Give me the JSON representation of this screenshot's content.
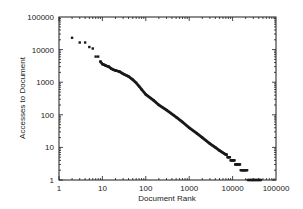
{
  "chart_data": {
    "type": "scatter",
    "title": "",
    "xlabel": "Document Rank",
    "ylabel": "Accesses to Document",
    "xscale": "log",
    "yscale": "log",
    "xlim": [
      1,
      100000
    ],
    "ylim": [
      1,
      100000
    ],
    "x_ticks": [
      "1",
      "10",
      "100",
      "1000",
      "10000",
      "100000"
    ],
    "y_ticks": [
      "1",
      "10",
      "100",
      "1000",
      "10000",
      "100000"
    ],
    "grid": false,
    "legend": null,
    "series": [
      {
        "name": "documents",
        "marker": "dot",
        "color": "#1a1a1a",
        "points": [
          [
            2,
            23000
          ],
          [
            3,
            16500
          ],
          [
            4,
            16500
          ],
          [
            5,
            12000
          ],
          [
            6,
            10800
          ],
          [
            7,
            6100
          ],
          [
            8,
            6100
          ],
          [
            9,
            4300
          ],
          [
            10,
            3600
          ],
          [
            11,
            3400
          ],
          [
            12,
            3200
          ],
          [
            14,
            3000
          ],
          [
            16,
            2600
          ],
          [
            18,
            2400
          ],
          [
            20,
            2300
          ],
          [
            25,
            2100
          ],
          [
            30,
            1800
          ],
          [
            40,
            1500
          ],
          [
            50,
            1200
          ],
          [
            60,
            950
          ],
          [
            70,
            750
          ],
          [
            80,
            600
          ],
          [
            100,
            420
          ],
          [
            150,
            280
          ],
          [
            200,
            200
          ],
          [
            300,
            140
          ],
          [
            500,
            85
          ],
          [
            700,
            60
          ],
          [
            1000,
            40
          ],
          [
            1500,
            27
          ],
          [
            2000,
            20
          ],
          [
            3000,
            13
          ],
          [
            4000,
            10
          ],
          [
            5000,
            8
          ],
          [
            7000,
            6
          ],
          [
            8000,
            5
          ],
          [
            10000,
            4
          ],
          [
            13000,
            3
          ],
          [
            18000,
            2
          ],
          [
            30000,
            1
          ],
          [
            45000,
            1
          ]
        ]
      }
    ]
  }
}
